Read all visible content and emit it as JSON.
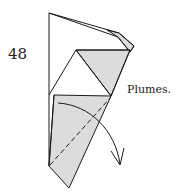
{
  "step": {
    "number": "48",
    "caption": "Plumes."
  },
  "colors": {
    "paper_shade": "#dcdcdc",
    "line": "#1a1a1a",
    "background": "#ffffff"
  },
  "diagram": {
    "marks": [
      "valley-fold-dashed-line",
      "fold-direction-arrow"
    ]
  }
}
